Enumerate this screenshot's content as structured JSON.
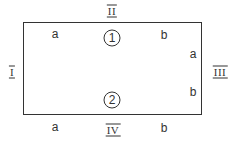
{
  "diagram": {
    "sides": {
      "top": "II",
      "left": "I",
      "right": "III",
      "bottom": "IV"
    },
    "circled": {
      "one": "1",
      "two": "2"
    },
    "points": {
      "top_a": "a",
      "top_b": "b",
      "right_a": "a",
      "right_b": "b",
      "bottom_a": "a",
      "bottom_b": "b"
    },
    "colors": {
      "stroke": "#333333",
      "background": "#ffffff"
    }
  }
}
